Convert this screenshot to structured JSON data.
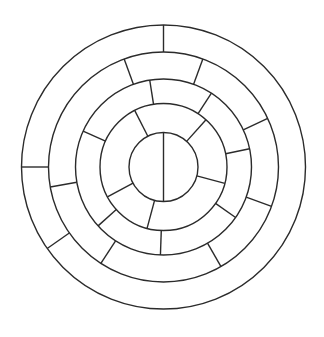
{
  "figure": {
    "background_color": "#ffffff",
    "stroke_color": "#2b2b2b",
    "stroke_width": 1.4,
    "width": 324,
    "height": 337
  },
  "geometry": {
    "center_x": 163.5,
    "center_y": 167.0,
    "radii": [
      34.5,
      63.5,
      88.0,
      115.0,
      142.0
    ],
    "radius_labels": [
      "r0-core",
      "r1",
      "r2",
      "r3",
      "r4-outer"
    ]
  },
  "chart_data": {
    "type": "pie",
    "xlabel": "",
    "ylabel": "",
    "legend_position": "none",
    "grid": false,
    "center": [
      163.5,
      167.0
    ],
    "rings": [
      {
        "name": "core-circle",
        "index": 0,
        "inner_radius": 0,
        "outer_radius": 34.5,
        "spoke_angles_deg": [
          90,
          270
        ],
        "segment_count": 2,
        "note": "single vertical diameter splitting the core circle"
      },
      {
        "name": "ring-1",
        "index": 1,
        "inner_radius": 34.5,
        "outer_radius": 63.5,
        "spoke_angles_deg": [
          117,
          48,
          345,
          255,
          208
        ],
        "segment_count": 5
      },
      {
        "name": "ring-2",
        "index": 2,
        "inner_radius": 63.5,
        "outer_radius": 88.0,
        "spoke_angles_deg": [
          99,
          57,
          12,
          325,
          268,
          222,
          156
        ],
        "segment_count": 7
      },
      {
        "name": "ring-3",
        "index": 3,
        "inner_radius": 88.0,
        "outer_radius": 115.0,
        "spoke_angles_deg": [
          110,
          70,
          25,
          340,
          300,
          237,
          190
        ],
        "segment_count": 7
      },
      {
        "name": "ring-4",
        "index": 4,
        "inner_radius": 115.0,
        "outer_radius": 142.0,
        "spoke_angles_deg": [
          90,
          180,
          215
        ],
        "segment_count": 3
      }
    ],
    "circle_count": 5,
    "total_spoke_count": 24
  }
}
